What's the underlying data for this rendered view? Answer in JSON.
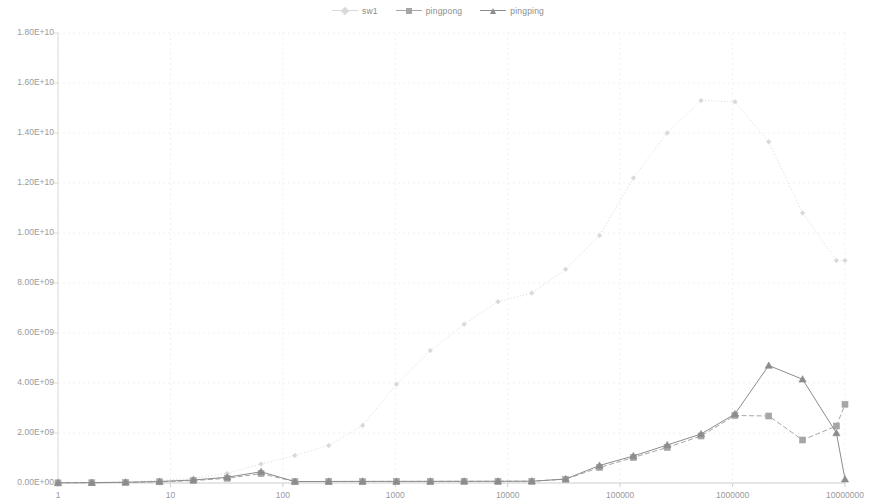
{
  "legend": {
    "position": "top-center",
    "items": [
      {
        "label": "sw1",
        "marker": "diamond",
        "color": "#d9d9d9",
        "line": "dotted"
      },
      {
        "label": "pingpong",
        "marker": "square",
        "color": "#a6a6a6",
        "line": "dashed"
      },
      {
        "label": "pingping",
        "marker": "triangle",
        "color": "#8c8c8c",
        "line": "solid"
      }
    ]
  },
  "axes": {
    "y_ticks": [
      "0.00E+00",
      "2.00E+09",
      "4.00E+09",
      "6.00E+09",
      "8.00E+09",
      "1.00E+10",
      "1.20E+10",
      "1.40E+10",
      "1.60E+10",
      "1.80E+10"
    ],
    "x_ticks": [
      "1",
      "10",
      "100",
      "1000",
      "10000",
      "100000",
      "1000000",
      "10000000"
    ]
  },
  "chart_data": {
    "type": "line",
    "title": "",
    "xlabel": "",
    "ylabel": "",
    "xscale": "log",
    "yscale": "linear",
    "xlim": [
      1,
      10000000
    ],
    "ylim": [
      0,
      18000000000
    ],
    "grid": true,
    "legend_position": "top-center",
    "x": [
      1,
      2,
      4,
      8,
      16,
      32,
      64,
      128,
      256,
      512,
      1024,
      2048,
      4096,
      8192,
      16384,
      32768,
      65536,
      131072,
      262144,
      524288,
      1048576,
      2097152,
      4194304,
      8388608
    ],
    "series": [
      {
        "name": "sw1",
        "marker": "diamond",
        "color": "#d9d9d9",
        "linestyle": "dotted",
        "values": [
          12000000,
          24000000,
          48000000,
          96000000,
          190000000,
          380000000,
          760000000,
          1100000000,
          1500000000,
          2300000000,
          3950000000,
          5300000000,
          6350000000,
          7250000000,
          7600000000,
          8550000000,
          9900000000,
          12200000000,
          14000000000,
          15300000000,
          15250000000,
          13650000000,
          10800000000,
          8900000000
        ]
      },
      {
        "name": "pingpong",
        "marker": "square",
        "color": "#a6a6a6",
        "linestyle": "dashed",
        "values": [
          6000000,
          12000000,
          24000000,
          48000000,
          95000000,
          190000000,
          375000000,
          55000000,
          60000000,
          62000000,
          63000000,
          64000000,
          66000000,
          68000000,
          70000000,
          150000000,
          620000000,
          1020000000,
          1420000000,
          1880000000,
          2700000000,
          2680000000,
          1720000000,
          2280000000
        ]
      },
      {
        "name": "pingping",
        "marker": "triangle",
        "color": "#8c8c8c",
        "linestyle": "solid",
        "values": [
          8000000,
          15000000,
          30000000,
          60000000,
          120000000,
          230000000,
          450000000,
          58000000,
          62000000,
          64000000,
          65000000,
          66000000,
          68000000,
          70000000,
          72000000,
          160000000,
          700000000,
          1080000000,
          1520000000,
          1960000000,
          2760000000,
          4700000000,
          4150000000,
          2000000000
        ]
      }
    ],
    "series_tail": {
      "note": "pingpong rises to 3.15E+09 and pingping falls to 1.5E+08 at x=10000000"
    },
    "final_points": {
      "pingpong_last": 3150000000,
      "pingping_last": 150000000,
      "sw1_last": 8900000000
    }
  }
}
